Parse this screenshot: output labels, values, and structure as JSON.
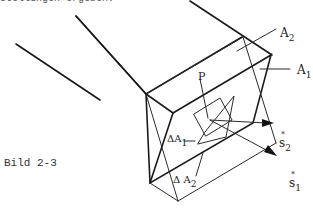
{
  "header": {
    "cut_text": "stellungen ergeben."
  },
  "figure": {
    "caption": "Bild 2-3",
    "labels": {
      "A2": {
        "main": "A",
        "sub": "2"
      },
      "A1": {
        "main": "A",
        "sub": "1"
      },
      "P": "P",
      "dA1": {
        "main": "ΔA",
        "sub": "1"
      },
      "dA2": {
        "main": "Δ A",
        "sub": "2"
      },
      "s2": {
        "main": "s",
        "sub": "2",
        "accent": "*"
      },
      "s1": {
        "main": "s",
        "sub": "1",
        "accent": "*"
      }
    }
  }
}
